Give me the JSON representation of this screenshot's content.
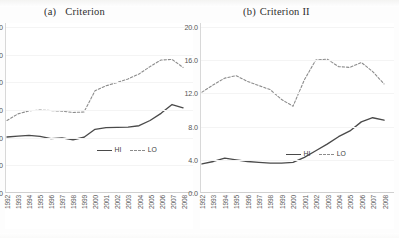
{
  "figure": {
    "width": 399,
    "height": 238,
    "background": "#ffffff"
  },
  "panels": [
    {
      "id": "a",
      "title_label": "(a)",
      "title_text": "Criterion"
    },
    {
      "id": "b",
      "title_label": "(b)",
      "title_text": "Criterion II"
    }
  ],
  "legend": {
    "hi_label": "HI",
    "lo_label": "LO",
    "hi_color": "#4a4a4a",
    "lo_color": "#8c8c8c"
  },
  "chart_data": [
    {
      "type": "line",
      "title": "(a) Criterion",
      "xlabel": "",
      "ylabel": "",
      "ylim": [
        0.0,
        60.0
      ],
      "yticks": [
        "0.0",
        "10.0",
        "20.0",
        "30.0",
        "40.0",
        "50.0",
        "60.0"
      ],
      "ytick_values": [
        0.0,
        10.0,
        20.0,
        30.0,
        40.0,
        50.0,
        60.0
      ],
      "grid": false,
      "legend_position": "inside-bottom-right",
      "categories": [
        "1992",
        "1993",
        "1994",
        "1995",
        "1996",
        "1997",
        "1998",
        "1999",
        "2000",
        "2001",
        "2002",
        "2003",
        "2004",
        "2005",
        "2006",
        "2007",
        "2008"
      ],
      "series": [
        {
          "name": "HI",
          "style": "solid",
          "color": "#4a4a4a",
          "values": [
            20.0,
            20.3,
            20.6,
            20.2,
            19.4,
            19.7,
            19.0,
            19.9,
            22.8,
            23.4,
            23.5,
            23.6,
            24.1,
            26.0,
            28.6,
            31.8,
            30.6
          ]
        },
        {
          "name": "LO",
          "style": "dashed",
          "color": "#8c8c8c",
          "values": [
            26.0,
            28.4,
            29.5,
            29.8,
            29.6,
            29.4,
            28.9,
            29.1,
            36.8,
            38.6,
            39.8,
            41.1,
            42.9,
            45.6,
            48.0,
            48.2,
            45.3
          ]
        }
      ]
    },
    {
      "type": "line",
      "title": "(b) Criterion II",
      "xlabel": "",
      "ylabel": "",
      "ylim": [
        0.0,
        20.0
      ],
      "yticks": [
        "0.0",
        "4.0",
        "8.0",
        "12.0",
        "16.0",
        "20.0"
      ],
      "ytick_values": [
        0.0,
        4.0,
        8.0,
        12.0,
        16.0,
        20.0
      ],
      "grid": false,
      "legend_position": "inside-bottom-right",
      "categories": [
        "1992",
        "1993",
        "1994",
        "1995",
        "1996",
        "1997",
        "1998",
        "1999",
        "2000",
        "2001",
        "2002",
        "2003",
        "2004",
        "2005",
        "2006",
        "2007",
        "2008"
      ],
      "series": [
        {
          "name": "HI",
          "style": "solid",
          "color": "#4a4a4a",
          "values": [
            3.4,
            3.7,
            4.1,
            3.9,
            3.7,
            3.6,
            3.5,
            3.5,
            3.6,
            4.2,
            5.0,
            5.8,
            6.7,
            7.4,
            8.5,
            9.0,
            8.7
          ]
        },
        {
          "name": "LO",
          "style": "dashed",
          "color": "#8c8c8c",
          "values": [
            12.1,
            13.0,
            13.8,
            14.1,
            13.4,
            12.9,
            12.4,
            11.2,
            10.4,
            13.6,
            16.0,
            16.1,
            15.2,
            15.1,
            15.7,
            14.6,
            13.1
          ]
        }
      ]
    }
  ]
}
